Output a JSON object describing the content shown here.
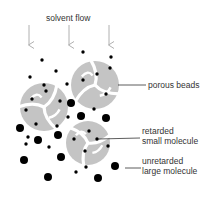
{
  "title": "solvent flow",
  "labels": {
    "porous_beads": "porous beads",
    "retarded_line1": "retarded",
    "retarded_line2": "small molecule",
    "unretarded_line1": "unretarded",
    "unretarded_line2": "large molecule"
  },
  "colors": {
    "bead": "#c4c4c4",
    "molecule": "#000000",
    "arrow": "#b0b0b0",
    "leader": "#333333"
  },
  "arrows": [
    {
      "x": 29,
      "y1": 25,
      "y2": 45
    },
    {
      "x": 69,
      "y1": 25,
      "y2": 45
    },
    {
      "x": 109,
      "y1": 25,
      "y2": 45
    }
  ],
  "beads": [
    {
      "cx": 95,
      "cy": 85,
      "r": 24
    },
    {
      "cx": 44,
      "cy": 107,
      "r": 24
    },
    {
      "cx": 88,
      "cy": 143,
      "r": 22
    }
  ],
  "small_molecules": [
    [
      42,
      60
    ],
    [
      83,
      52
    ],
    [
      111,
      57
    ],
    [
      56,
      71
    ],
    [
      30,
      77
    ],
    [
      110,
      68
    ],
    [
      97,
      74
    ],
    [
      83,
      80
    ],
    [
      67,
      84
    ],
    [
      106,
      94
    ],
    [
      46,
      91
    ],
    [
      32,
      99
    ],
    [
      60,
      101
    ],
    [
      26,
      110
    ],
    [
      83,
      115
    ],
    [
      94,
      109
    ],
    [
      68,
      117
    ],
    [
      36,
      124
    ],
    [
      57,
      126
    ],
    [
      28,
      137
    ],
    [
      74,
      139
    ],
    [
      89,
      131
    ],
    [
      97,
      139
    ],
    [
      85,
      151
    ],
    [
      26,
      144
    ],
    [
      49,
      147
    ],
    [
      108,
      146
    ],
    [
      86,
      167
    ],
    [
      44,
      85
    ],
    [
      76,
      172
    ]
  ],
  "large_molecules": [
    [
      71,
      103
    ],
    [
      81,
      116
    ],
    [
      106,
      118
    ],
    [
      20,
      128
    ],
    [
      38,
      140
    ],
    [
      58,
      135
    ],
    [
      24,
      160
    ],
    [
      61,
      157
    ],
    [
      48,
      177
    ],
    [
      98,
      178
    ],
    [
      115,
      166
    ]
  ],
  "leaders": [
    {
      "x1": 118,
      "y1": 85,
      "x2": 146,
      "y2": 85
    },
    {
      "x1": 98,
      "y1": 139,
      "x2": 140,
      "y2": 138
    },
    {
      "x1": 125,
      "y1": 168,
      "x2": 141,
      "y2": 168
    }
  ]
}
